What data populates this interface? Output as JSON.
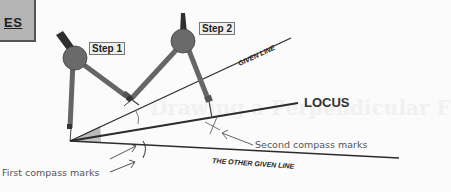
{
  "header_fragment": {
    "text": "ES",
    "suffix": "'."
  },
  "background_ghost_text": "Drawing a Perpendicular F",
  "labels": {
    "step1": "Step 1",
    "step2": "Step 2",
    "given_line": "GIVEN LINE",
    "locus": "LOCUS",
    "other_given_line": "THE OTHER GIVEN LINE",
    "second_marks": "Second compass marks",
    "first_marks": "First compass marks"
  },
  "colors": {
    "compass_body": "#6a6a6a",
    "compass_dark": "#333333",
    "line": "#2b2b2b",
    "angle_fill": "#b9b9b9",
    "box_fill": "#b4b4b4"
  }
}
